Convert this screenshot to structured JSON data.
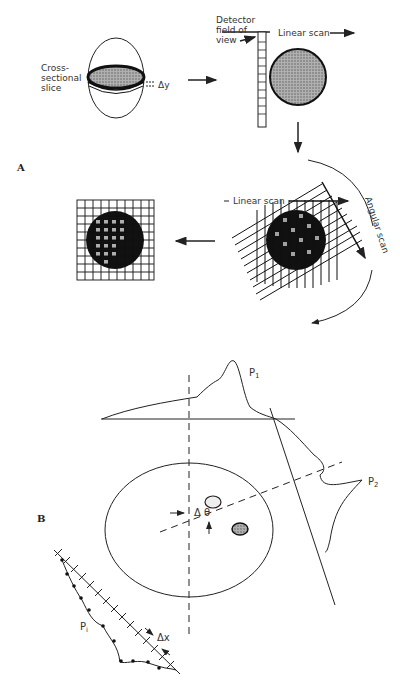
{
  "figure": {
    "panels": [
      {
        "id": "A",
        "label": "A",
        "labels": {
          "slice_line1": "Cross-",
          "slice_line2": "sectional",
          "slice_line3": "slice",
          "delta_y": "Δy",
          "detector_line1": "Detector",
          "detector_line2": "field of",
          "detector_line3": "view",
          "linear_scan_top": "Linear scan",
          "linear_scan_rot": "Linear scan",
          "angular_scan": "Angular scan"
        }
      },
      {
        "id": "B",
        "label": "B",
        "labels": {
          "p1": "P",
          "p1_sub": "1",
          "p2": "P",
          "p2_sub": "2",
          "pi": "P",
          "pi_sub": "i",
          "delta_theta": "Δ θ",
          "delta_x": "Δx"
        }
      }
    ],
    "colors": {
      "ink": "#222222",
      "fill_gray": "#9a9a9a",
      "fill_dark": "#1a1a1a",
      "background": "#ffffff"
    }
  }
}
